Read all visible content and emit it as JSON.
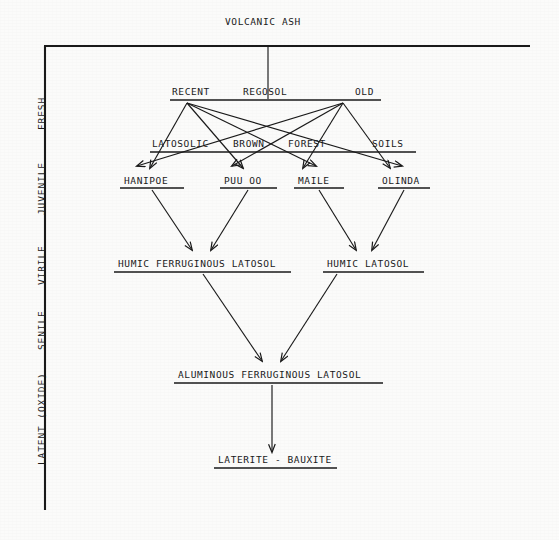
{
  "diagram": {
    "title": "VOLCANIC ASH",
    "axis_stages": [
      {
        "label": "FRESH",
        "x": 36,
        "y": 130
      },
      {
        "label": "JUVENILE",
        "x": 36,
        "y": 215
      },
      {
        "label": "VIRILE",
        "x": 36,
        "y": 285
      },
      {
        "label": "SENILE",
        "x": 36,
        "y": 350
      },
      {
        "label": "LATENT (OXIDE)",
        "x": 36,
        "y": 465
      }
    ],
    "nodes": [
      {
        "id": "volcanic-ash",
        "label": "VOLCANIC ASH",
        "x": 225,
        "y": 16
      },
      {
        "id": "recent",
        "label": "RECENT",
        "x": 172,
        "y": 86
      },
      {
        "id": "regosol",
        "label": "REGOSOL",
        "x": 243,
        "y": 86
      },
      {
        "id": "old",
        "label": "OLD",
        "x": 355,
        "y": 86
      },
      {
        "id": "latosolic",
        "label": "LATOSOLIC",
        "x": 152,
        "y": 138
      },
      {
        "id": "brown",
        "label": "BROWN",
        "x": 233,
        "y": 138
      },
      {
        "id": "forest",
        "label": "FOREST",
        "x": 288,
        "y": 138
      },
      {
        "id": "soils",
        "label": "SOILS",
        "x": 372,
        "y": 138
      },
      {
        "id": "hanipoe",
        "label": "HANIPOE",
        "x": 124,
        "y": 175
      },
      {
        "id": "puu-oo",
        "label": "PUU OO",
        "x": 224,
        "y": 175
      },
      {
        "id": "maile",
        "label": "MAILE",
        "x": 298,
        "y": 175
      },
      {
        "id": "olinda",
        "label": "OLINDA",
        "x": 382,
        "y": 175
      },
      {
        "id": "humic-ferruginous-latosol",
        "label": "HUMIC FERRUGINOUS LATOSOL",
        "x": 118,
        "y": 258
      },
      {
        "id": "humic-latosol",
        "label": "HUMIC LATOSOL",
        "x": 327,
        "y": 258
      },
      {
        "id": "aluminous-ferruginous-latosol",
        "label": "ALUMINOUS FERRUGINOUS LATOSOL",
        "x": 178,
        "y": 369
      },
      {
        "id": "laterite-bauxite",
        "label": "LATERITE - BAUXITE",
        "x": 218,
        "y": 454
      }
    ],
    "underlines": [
      {
        "for": "volcanic-ash",
        "x1": 44,
        "y1": 46,
        "x2": 530,
        "y2": 46
      },
      {
        "for": "recent-regosol-old",
        "x1": 170,
        "y1": 100,
        "x2": 381,
        "y2": 100
      },
      {
        "for": "latosolic-brown-forest-soils",
        "x1": 150,
        "y1": 152,
        "x2": 416,
        "y2": 152
      },
      {
        "for": "hanipoe",
        "x1": 120,
        "y1": 188,
        "x2": 184,
        "y2": 188
      },
      {
        "for": "puu-oo",
        "x1": 220,
        "y1": 188,
        "x2": 277,
        "y2": 188
      },
      {
        "for": "maile",
        "x1": 294,
        "y1": 188,
        "x2": 344,
        "y2": 188
      },
      {
        "for": "olinda",
        "x1": 378,
        "y1": 188,
        "x2": 430,
        "y2": 188
      },
      {
        "for": "humic-ferruginous-latosol",
        "x1": 114,
        "y1": 272,
        "x2": 291,
        "y2": 272
      },
      {
        "for": "humic-latosol",
        "x1": 323,
        "y1": 272,
        "x2": 424,
        "y2": 272
      },
      {
        "for": "aluminous-ferruginous-latosol",
        "x1": 174,
        "y1": 383,
        "x2": 383,
        "y2": 383
      },
      {
        "for": "laterite-bauxite",
        "x1": 214,
        "y1": 468,
        "x2": 337,
        "y2": 468
      }
    ],
    "axis_line": {
      "x1": 45,
      "y1": 46,
      "x2": 45,
      "y2": 510
    },
    "connectors": [
      {
        "from": "volcanic-ash",
        "to": "recent-regosol-old",
        "x1": 268,
        "y1": 47,
        "x2": 268,
        "y2": 99,
        "arrow": false
      },
      {
        "from": "recent",
        "to": "hanipoe",
        "x1": 187,
        "y1": 103,
        "x2": 150,
        "y2": 168,
        "arrow": true
      },
      {
        "from": "recent",
        "to": "puu-oo",
        "x1": 187,
        "y1": 103,
        "x2": 243,
        "y2": 168,
        "arrow": true
      },
      {
        "from": "recent",
        "to": "maile",
        "x1": 187,
        "y1": 103,
        "x2": 316,
        "y2": 166,
        "arrow": true
      },
      {
        "from": "recent",
        "to": "olinda",
        "x1": 187,
        "y1": 103,
        "x2": 402,
        "y2": 166,
        "arrow": true
      },
      {
        "from": "old",
        "to": "hanipoe",
        "x1": 343,
        "y1": 103,
        "x2": 137,
        "y2": 166,
        "arrow": true
      },
      {
        "from": "old",
        "to": "puu-oo",
        "x1": 343,
        "y1": 103,
        "x2": 232,
        "y2": 166,
        "arrow": true
      },
      {
        "from": "old",
        "to": "maile",
        "x1": 343,
        "y1": 103,
        "x2": 303,
        "y2": 168,
        "arrow": true
      },
      {
        "from": "old",
        "to": "olinda",
        "x1": 343,
        "y1": 103,
        "x2": 390,
        "y2": 168,
        "arrow": true
      },
      {
        "from": "hanipoe",
        "to": "humic-ferruginous-latosol",
        "x1": 152,
        "y1": 190,
        "x2": 192,
        "y2": 250,
        "arrow": true
      },
      {
        "from": "puu-oo",
        "to": "humic-ferruginous-latosol",
        "x1": 248,
        "y1": 190,
        "x2": 211,
        "y2": 250,
        "arrow": true
      },
      {
        "from": "maile",
        "to": "humic-latosol",
        "x1": 319,
        "y1": 190,
        "x2": 356,
        "y2": 250,
        "arrow": true
      },
      {
        "from": "olinda",
        "to": "humic-latosol",
        "x1": 404,
        "y1": 190,
        "x2": 372,
        "y2": 250,
        "arrow": true
      },
      {
        "from": "humic-ferruginous-latosol",
        "to": "aluminous-ferruginous-latosol",
        "x1": 203,
        "y1": 274,
        "x2": 262,
        "y2": 361,
        "arrow": true
      },
      {
        "from": "humic-latosol",
        "to": "aluminous-ferruginous-latosol",
        "x1": 337,
        "y1": 274,
        "x2": 281,
        "y2": 361,
        "arrow": true
      },
      {
        "from": "aluminous-ferruginous-latosol",
        "to": "laterite-bauxite",
        "x1": 272,
        "y1": 385,
        "x2": 272,
        "y2": 452,
        "arrow": true
      }
    ],
    "colors": {
      "ink": "#1a1a1a",
      "paper": "#fbfbfa"
    }
  }
}
